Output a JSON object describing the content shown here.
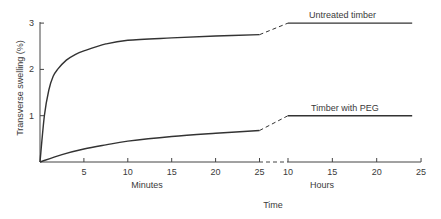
{
  "chart_data": {
    "type": "line",
    "title": "",
    "ylabel": "Transverse swelling (%)",
    "xlabel": "Time",
    "ylim": [
      0,
      3
    ],
    "y_ticks": [
      1,
      2,
      3
    ],
    "grid": false,
    "legend": "inline labels above the hour segments",
    "axes": [
      {
        "name": "minutes",
        "label": "Minutes",
        "range": [
          0,
          25
        ],
        "ticks": [
          5,
          10,
          15,
          20,
          25
        ]
      },
      {
        "name": "hours",
        "label": "Hours",
        "range": [
          10,
          25
        ],
        "ticks": [
          10,
          15,
          20,
          25
        ]
      }
    ],
    "axis_break": "dashed segment between 25 minutes and 10 hours",
    "series": [
      {
        "name": "Untreated timber",
        "minutes": {
          "x": [
            0,
            0.5,
            1,
            1.5,
            2,
            3,
            4,
            5,
            7.5,
            10,
            15,
            20,
            25
          ],
          "y": [
            0,
            1.0,
            1.55,
            1.85,
            2.0,
            2.2,
            2.32,
            2.4,
            2.55,
            2.63,
            2.68,
            2.72,
            2.75
          ]
        },
        "hours": {
          "x": [
            10,
            15,
            20,
            24
          ],
          "y": [
            3.0,
            3.0,
            3.0,
            3.0
          ]
        }
      },
      {
        "name": "Timber with PEG",
        "minutes": {
          "x": [
            0,
            2.5,
            5,
            7.5,
            10,
            15,
            20,
            25
          ],
          "y": [
            0,
            0.16,
            0.28,
            0.37,
            0.45,
            0.55,
            0.62,
            0.68
          ]
        },
        "hours": {
          "x": [
            10,
            15,
            20,
            24
          ],
          "y": [
            1.0,
            1.0,
            1.0,
            1.0
          ]
        }
      }
    ]
  },
  "labels": {
    "ylabel": "Transverse swelling (%)",
    "minutes": "Minutes",
    "hours": "Hours",
    "time": "Time",
    "series_untreated": "Untreated timber",
    "series_peg": "Timber with PEG"
  },
  "colors": {
    "line": "#333333",
    "text": "#3a3a3a",
    "background": "#ffffff"
  }
}
